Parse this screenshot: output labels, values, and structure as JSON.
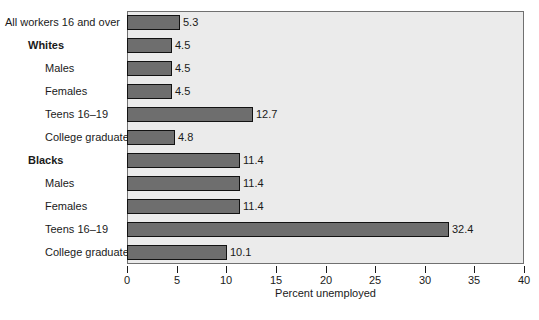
{
  "chart_data": {
    "type": "bar",
    "orientation": "horizontal",
    "title": "",
    "subtitle": "",
    "xlabel": "Percent unemployed",
    "ylabel": "",
    "xlim": [
      0,
      40
    ],
    "xticks": [
      0,
      5,
      10,
      15,
      20,
      25,
      30,
      35,
      40
    ],
    "xtick_labels": [
      "0",
      "5",
      "10",
      "15",
      "20",
      "25",
      "30",
      "35",
      "40"
    ],
    "grid": false,
    "legend": null,
    "categories": [
      "All workers 16 and over",
      "Whites",
      "Males",
      "Females",
      "Teens 16–19",
      "College graduates",
      "Blacks",
      "Males",
      "Females",
      "Teens 16–19",
      "College graduates"
    ],
    "values": [
      5.3,
      4.5,
      4.5,
      4.5,
      12.7,
      4.8,
      11.4,
      11.4,
      11.4,
      32.4,
      10.1
    ],
    "value_labels": [
      "5.3",
      "4.5",
      "4.5",
      "4.5",
      "12.7",
      "4.8",
      "11.4",
      "11.4",
      "11.4",
      "32.4",
      "10.1"
    ],
    "bars": [
      {
        "label": "All workers 16 and over",
        "value": 5.3,
        "value_label": "5.3",
        "indent": 0,
        "bold": false
      },
      {
        "label": "Whites",
        "value": 4.5,
        "value_label": "4.5",
        "indent": 1,
        "bold": true
      },
      {
        "label": "Males",
        "value": 4.5,
        "value_label": "4.5",
        "indent": 2,
        "bold": false
      },
      {
        "label": "Females",
        "value": 4.5,
        "value_label": "4.5",
        "indent": 2,
        "bold": false
      },
      {
        "label": "Teens 16–19",
        "value": 12.7,
        "value_label": "12.7",
        "indent": 2,
        "bold": false
      },
      {
        "label": "College graduates",
        "value": 4.8,
        "value_label": "4.8",
        "indent": 2,
        "bold": false
      },
      {
        "label": "Blacks",
        "value": 11.4,
        "value_label": "11.4",
        "indent": 1,
        "bold": true
      },
      {
        "label": "Males",
        "value": 11.4,
        "value_label": "11.4",
        "indent": 2,
        "bold": false
      },
      {
        "label": "Females",
        "value": 11.4,
        "value_label": "11.4",
        "indent": 2,
        "bold": false
      },
      {
        "label": "Teens 16–19",
        "value": 32.4,
        "value_label": "32.4",
        "indent": 2,
        "bold": false
      },
      {
        "label": "College graduates",
        "value": 10.1,
        "value_label": "10.1",
        "indent": 2,
        "bold": false
      }
    ],
    "colors": {
      "bar_fill": "#6e6e6e",
      "bar_border": "#121212",
      "plot_background": "#ebebeb",
      "plot_border": "#707070",
      "page_background": "#ffffff",
      "text": "#1a1a1a"
    }
  }
}
